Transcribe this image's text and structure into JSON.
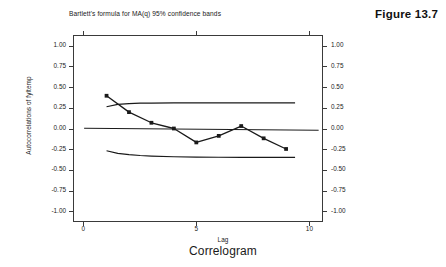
{
  "figure": {
    "label": "Figure 13.7"
  },
  "caption": {
    "text": "Correlogram"
  },
  "chart_data": {
    "type": "line",
    "title": "Bartlett's formula for MA(q) 95% confidence bands",
    "xlabel": "Lag",
    "ylabel": "Autocorrelations of fyltemp",
    "xlim": [
      -0.45,
      10.6
    ],
    "ylim": [
      -1.13,
      1.13
    ],
    "grid": false,
    "legend": "none",
    "x_ticks": [
      0,
      5,
      10
    ],
    "x_tick_labels": [
      "0",
      "5",
      "10"
    ],
    "y_ticks": [
      1.0,
      0.75,
      0.5,
      0.25,
      0.0,
      -0.25,
      -0.5,
      -0.75,
      -1.0
    ],
    "y_tick_labels": [
      "1.00",
      "0.75",
      "0.50",
      "0.25",
      "0.00",
      "-0.25",
      "-0.50",
      "-0.75",
      "-1.00"
    ],
    "y_tick_labels_right": [
      "1.00",
      "0.75",
      "0.50",
      "0.25",
      "0.00",
      "-0.25",
      "-0.50",
      "-0.75",
      "-1.00"
    ],
    "series": [
      {
        "name": "Autocorrelations of fyltemp",
        "marker": "filled-square",
        "color": "#1a1a1a",
        "x": [
          1,
          2,
          3,
          4,
          5,
          6,
          7,
          8,
          9
        ],
        "values": [
          0.4,
          0.2,
          0.07,
          0.0,
          -0.17,
          -0.09,
          0.03,
          -0.12,
          -0.25
        ]
      },
      {
        "name": "Upper 95% confidence band",
        "marker": "none",
        "color": "#1a1a1a",
        "x": [
          1,
          1.5,
          2,
          2.5,
          3,
          4,
          5,
          6,
          7,
          8,
          9,
          9.4
        ],
        "values": [
          0.266,
          0.295,
          0.305,
          0.309,
          0.311,
          0.312,
          0.312,
          0.313,
          0.313,
          0.313,
          0.313,
          0.313
        ]
      },
      {
        "name": "Lower 95% confidence band",
        "marker": "none",
        "color": "#1a1a1a",
        "x": [
          1,
          1.5,
          2,
          2.5,
          3,
          4,
          5,
          6,
          7,
          8,
          9,
          9.4
        ],
        "values": [
          -0.272,
          -0.304,
          -0.32,
          -0.33,
          -0.337,
          -0.345,
          -0.349,
          -0.351,
          -0.352,
          -0.353,
          -0.353,
          -0.353
        ]
      },
      {
        "name": "Zero reference line",
        "marker": "none",
        "color": "#1a1a1a",
        "x": [
          0,
          10.45
        ],
        "values": [
          0.003,
          -0.022
        ]
      }
    ]
  }
}
